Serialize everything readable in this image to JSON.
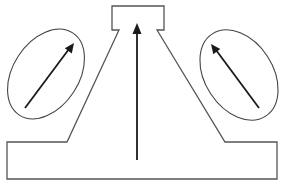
{
  "diagram": {
    "elements": [
      {
        "id": "body-outline",
        "kind": "polygon-outline",
        "description": "base block with tapered neck and small top box"
      },
      {
        "id": "central-arrow",
        "kind": "arrow",
        "direction": "up"
      },
      {
        "id": "left-ellipse",
        "kind": "ellipse",
        "contains": "left-arrow"
      },
      {
        "id": "left-arrow",
        "kind": "arrow",
        "direction": "up-right"
      },
      {
        "id": "right-ellipse",
        "kind": "ellipse",
        "contains": "right-arrow"
      },
      {
        "id": "right-arrow",
        "kind": "arrow",
        "direction": "up-left"
      }
    ],
    "colors": {
      "outline": "#555555",
      "ellipse": "#444444",
      "arrow": "#1a1a1a",
      "background": "#ffffff"
    }
  }
}
